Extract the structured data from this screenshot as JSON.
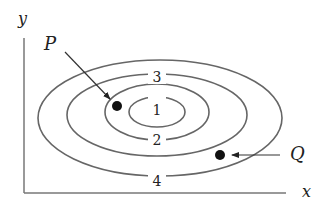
{
  "diagram": {
    "type": "contour-plot",
    "axes": {
      "x_label": "x",
      "y_label": "y"
    },
    "contours": [
      {
        "level": "1",
        "label": "1"
      },
      {
        "level": "2",
        "label": "2"
      },
      {
        "level": "3",
        "label": "3"
      },
      {
        "level": "4",
        "label": "4"
      }
    ],
    "points": [
      {
        "name": "P",
        "label": "P"
      },
      {
        "name": "Q",
        "label": "Q"
      }
    ],
    "colors": {
      "line": "#666666",
      "point": "#111111",
      "text": "#222222"
    }
  }
}
